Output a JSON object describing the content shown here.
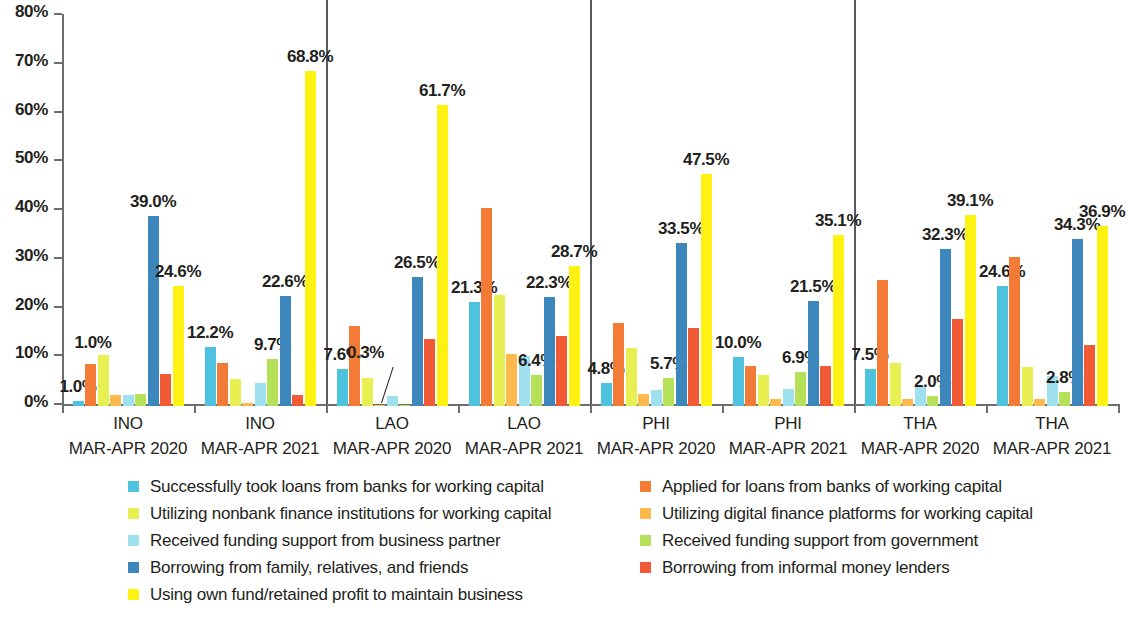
{
  "chart_data": {
    "type": "bar",
    "title": "",
    "xlabel": "",
    "ylabel": "",
    "ylim": [
      0,
      80
    ],
    "ytick_labels": [
      "0%",
      "10%",
      "20%",
      "30%",
      "40%",
      "50%",
      "60%",
      "70%",
      "80%"
    ],
    "ytick_values": [
      0,
      10,
      20,
      30,
      40,
      50,
      60,
      70,
      80
    ],
    "grid": false,
    "legend_position": "bottom",
    "categories": [
      "INO MAR-APR 2020",
      "INO MAR-APR 2021",
      "LAO MAR-APR 2020",
      "LAO MAR-APR 2021",
      "PHI MAR-APR 2020",
      "PHI MAR-APR 2021",
      "THA MAR-APR 2020",
      "THA MAR-APR 2021"
    ],
    "category_lines": [
      {
        "country": "INO",
        "period": "MAR-APR 2020"
      },
      {
        "country": "INO",
        "period": "MAR-APR 2021"
      },
      {
        "country": "LAO",
        "period": "MAR-APR 2020"
      },
      {
        "country": "LAO",
        "period": "MAR-APR 2021"
      },
      {
        "country": "PHI",
        "period": "MAR-APR 2020"
      },
      {
        "country": "PHI",
        "period": "MAR-APR 2021"
      },
      {
        "country": "THA",
        "period": "MAR-APR 2020"
      },
      {
        "country": "THA",
        "period": "MAR-APR 2021"
      }
    ],
    "country_dividers_after": [
      1,
      3,
      5
    ],
    "series": [
      {
        "name": "Successfully took loans from  banks for working capital",
        "color": "#4ec3e0",
        "values": [
          1.0,
          12.2,
          7.6,
          21.3,
          4.8,
          10.0,
          7.5,
          24.6
        ],
        "labels": [
          "1.0%",
          "12.2%",
          "7.6%",
          "21.3%",
          "4.8%",
          "10.0%",
          "7.5%",
          "24.6%"
        ]
      },
      {
        "name": "Applied for loans from banks of working capital",
        "color": "#f47b35",
        "values": [
          8.7,
          8.8,
          16.5,
          40.6,
          17.0,
          8.3,
          25.8,
          30.5
        ],
        "labels": [
          null,
          null,
          null,
          null,
          null,
          null,
          null,
          null
        ]
      },
      {
        "name": "Utilizing nonbank finance institutions for working capital",
        "color": "#e8ef52",
        "values": [
          10.5,
          5.6,
          5.7,
          22.8,
          11.8,
          6.3,
          8.8,
          8.0
        ],
        "labels": [
          null,
          null,
          null,
          null,
          null,
          null,
          null,
          null
        ]
      },
      {
        "name": "Utilizing digital finance platforms for working capital",
        "color": "#fdb94e",
        "values": [
          2.3,
          0.7,
          0.3,
          10.7,
          2.5,
          1.5,
          1.5,
          1.5
        ],
        "labels": [
          null,
          null,
          "0.3%",
          null,
          null,
          null,
          null,
          null
        ]
      },
      {
        "name": "Received funding support from business partner",
        "color": "#9fe0ef",
        "values": [
          2.3,
          4.7,
          2.0,
          10.3,
          3.2,
          3.5,
          4.0,
          6.2
        ],
        "labels": [
          null,
          null,
          null,
          null,
          null,
          null,
          null,
          null
        ]
      },
      {
        "name": "Received funding support from government",
        "color": "#b5e05a",
        "values": [
          2.5,
          9.7,
          0.3,
          6.4,
          5.7,
          6.9,
          2.0,
          2.8
        ],
        "labels": [
          null,
          "9.7%",
          null,
          "6.4%",
          "5.7%",
          "6.9%",
          "2.0%",
          "2.8%"
        ]
      },
      {
        "name": "Borrowing from family, relatives, and friends",
        "color": "#3d87bd",
        "values": [
          39.0,
          22.6,
          26.5,
          22.3,
          33.5,
          21.5,
          32.3,
          34.3
        ],
        "labels": [
          "39.0%",
          "22.6%",
          "26.5%",
          "22.3%",
          "33.5%",
          "21.5%",
          "32.3%",
          "34.3%"
        ]
      },
      {
        "name": "Borrowing from informal money lenders",
        "color": "#f05a34",
        "values": [
          6.5,
          2.3,
          13.8,
          14.3,
          16.0,
          8.2,
          17.8,
          12.5
        ],
        "labels": [
          null,
          null,
          null,
          null,
          null,
          null,
          null,
          null
        ]
      },
      {
        "name": "Using own fund/retained profit to maintain business",
        "color": "#fff212",
        "values": [
          24.6,
          68.8,
          61.7,
          28.7,
          47.5,
          35.1,
          39.1,
          36.9
        ],
        "labels": [
          "24.6%",
          "68.8%",
          "61.7%",
          "28.7%",
          "47.5%",
          "35.1%",
          "39.1%",
          "36.9%"
        ]
      }
    ],
    "value_label_overrides": {
      "2": {
        "0": {
          "text": "1.0%",
          "dx": -10,
          "dy": -2
        }
      }
    }
  },
  "legend": {
    "left_column": [
      {
        "label": "Successfully took loans from  banks for working capital",
        "color": "#4ec3e0"
      },
      {
        "label": "Utilizing nonbank finance institutions for working capital",
        "color": "#e8ef52"
      },
      {
        "label": "Received funding support from business partner",
        "color": "#9fe0ef"
      },
      {
        "label": "Borrowing from family, relatives, and friends",
        "color": "#3d87bd"
      },
      {
        "label": "Using own fund/retained profit to maintain business",
        "color": "#fff212"
      }
    ],
    "right_column": [
      {
        "label": "Applied for loans from banks of working capital",
        "color": "#f47b35"
      },
      {
        "label": "Utilizing digital finance platforms for working capital",
        "color": "#fdb94e"
      },
      {
        "label": "Received funding support from government",
        "color": "#b5e05a"
      },
      {
        "label": "Borrowing from informal money lenders",
        "color": "#f05a34"
      }
    ]
  }
}
